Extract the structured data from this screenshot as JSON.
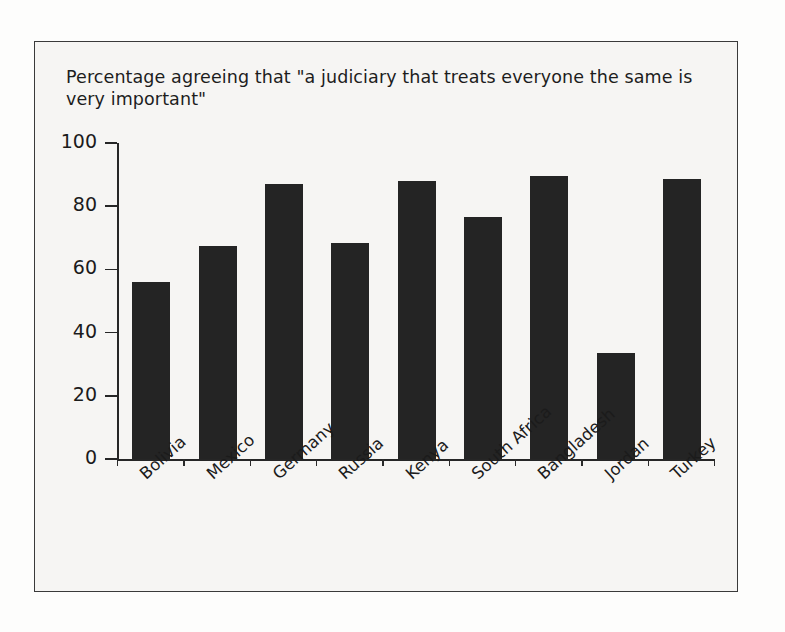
{
  "figure": {
    "title": "Percentage agreeing that \"a judiciary that treats everyone the\nsame is very important\"",
    "frame_color": "#3a3a3a",
    "background_color": "#f6f5f3",
    "bar_color": "#242424"
  },
  "chart_data": {
    "type": "bar",
    "title": "Percentage agreeing that \"a judiciary that treats everyone the same is very important\"",
    "xlabel": "",
    "ylabel": "",
    "ylim": [
      0,
      100
    ],
    "yticks": [
      0,
      20,
      40,
      60,
      80,
      100
    ],
    "ytick_labels": [
      "0",
      "20",
      "40",
      "60",
      "80",
      "100"
    ],
    "grid": false,
    "legend": false,
    "categories": [
      "Bolivia",
      "Mexico",
      "Germany",
      "Russia",
      "Kenya",
      "South Africa",
      "Bangladesh",
      "Jordan",
      "Turkey"
    ],
    "values": [
      56,
      67.5,
      87,
      68.5,
      88,
      76.5,
      89.5,
      33.5,
      88.5
    ],
    "series": [
      {
        "name": "Percentage agreeing",
        "values": [
          56,
          67.5,
          87,
          68.5,
          88,
          76.5,
          89.5,
          33.5,
          88.5
        ]
      }
    ]
  }
}
